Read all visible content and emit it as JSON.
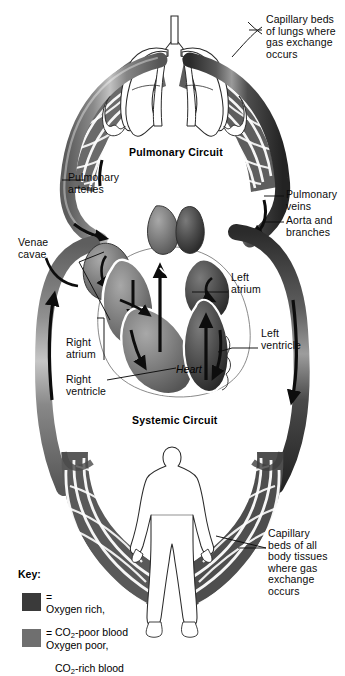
{
  "figure": {
    "type": "anatomical-diagram",
    "palette": {
      "oxygen_rich": "#3a3a3a",
      "oxygen_poor": "#6f6f6f",
      "outline": "#1a1a1a",
      "background": "#ffffff",
      "mesh_dark": "#4a4a4a",
      "mesh_light": "#767676"
    }
  },
  "circuit_titles": {
    "pulmonary": "Pulmonary Circuit",
    "systemic": "Systemic Circuit"
  },
  "organ_labels": {
    "heart": "Heart"
  },
  "annotations": {
    "capillary_lungs": "Capillary beds\nof lungs where\ngas exchange\noccurs",
    "pulmonary_arteries": "Pulmonary\narteries",
    "pulmonary_veins": "Pulmonary\nveins",
    "aorta_branches": "Aorta and\nbranches",
    "venae_cavae": "Venae\ncavae",
    "left_atrium": "Left\natrium",
    "left_ventricle": "Left\nventricle",
    "right_atrium": "Right\natrium",
    "right_ventricle": "Right\nventricle",
    "capillary_body": "Capillary\nbeds of all\nbody tissues\nwhere gas\nexchange\noccurs"
  },
  "key": {
    "title": "Key:",
    "entries": [
      {
        "swatch_color": "#3a3a3a",
        "equals": "=",
        "line1": "Oxygen rich,",
        "line2_pre": "CO",
        "line2_sub": "2",
        "line2_post": "-poor blood"
      },
      {
        "swatch_color": "#6f6f6f",
        "equals": "=",
        "line1": "Oxygen poor,",
        "line2_pre": "CO",
        "line2_sub": "2",
        "line2_post": "-rich blood"
      }
    ]
  }
}
